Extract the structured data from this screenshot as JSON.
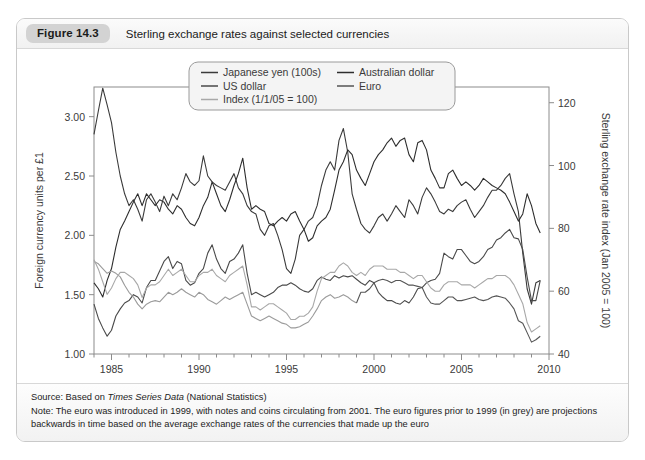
{
  "figure": {
    "badge": "Figure 14.3",
    "title": "Sterling exchange rates against selected currencies"
  },
  "footer": {
    "source_prefix": "Source: Based on ",
    "source_italic": "Times Series Data",
    "source_suffix": " (National Statistics)",
    "note": "Note: The euro was introduced in 1999, with notes and coins circulating from 2001. The euro figures prior to 1999 (in grey) are projections backwards in time based on the average exchange rates of the currencies that made up the euro"
  },
  "colors": {
    "yen": "#3b3b3b",
    "us_dollar": "#4a4a4a",
    "index": "#a8a8a8",
    "australian_dollar": "#2e2e2e",
    "euro": "#555555",
    "euro_projected": "#9b9b9b",
    "axis": "#8c8c8c",
    "text": "#3a3a3a",
    "legend_bg": "#f4f4f4",
    "legend_border": "#9a9a9a"
  },
  "chart_data": {
    "type": "line",
    "title": "Sterling exchange rates against selected currencies",
    "xlabel": "",
    "ylabel": "Foreign currency units per £1",
    "y2label": "Sterling exchange rate index (Jan 2005 = 100)",
    "xlim": [
      1984,
      2010
    ],
    "ylim": [
      1.0,
      3.25
    ],
    "y2lim": [
      40,
      125
    ],
    "yticks": [
      "1.00",
      "1.50",
      "2.00",
      "2.50",
      "3.00"
    ],
    "ytick_values": [
      1.0,
      1.5,
      2.0,
      2.5,
      3.0
    ],
    "y2ticks": [
      "40",
      "60",
      "80",
      "100",
      "120"
    ],
    "y2tick_values": [
      40,
      60,
      80,
      100,
      120
    ],
    "xticks": [
      "1985",
      "1990",
      "1995",
      "2000",
      "2005",
      "2010"
    ],
    "xtick_values": [
      1985,
      1990,
      1995,
      2000,
      2005,
      2010
    ],
    "grid": false,
    "legend_position": "top-center",
    "legend": [
      {
        "label": "Japanese yen (100s)",
        "color": "#3b3b3b"
      },
      {
        "label": "US dollar",
        "color": "#4a4a4a"
      },
      {
        "label": "Index (1/1/05 = 100)",
        "color": "#a8a8a8"
      },
      {
        "label": "Australian dollar",
        "color": "#2e2e2e"
      },
      {
        "label": "Euro",
        "color": "#555555"
      }
    ],
    "x": [
      1984.0,
      1984.25,
      1984.5,
      1984.75,
      1985.0,
      1985.25,
      1985.5,
      1985.75,
      1986.0,
      1986.25,
      1986.5,
      1986.75,
      1987.0,
      1987.25,
      1987.5,
      1987.75,
      1988.0,
      1988.25,
      1988.5,
      1988.75,
      1989.0,
      1989.25,
      1989.5,
      1989.75,
      1990.0,
      1990.25,
      1990.5,
      1990.75,
      1991.0,
      1991.25,
      1991.5,
      1991.75,
      1992.0,
      1992.25,
      1992.5,
      1992.75,
      1993.0,
      1993.25,
      1993.5,
      1993.75,
      1994.0,
      1994.25,
      1994.5,
      1994.75,
      1995.0,
      1995.25,
      1995.5,
      1995.75,
      1996.0,
      1996.25,
      1996.5,
      1996.75,
      1997.0,
      1997.25,
      1997.5,
      1997.75,
      1998.0,
      1998.25,
      1998.5,
      1998.75,
      1999.0,
      1999.25,
      1999.5,
      1999.75,
      2000.0,
      2000.25,
      2000.5,
      2000.75,
      2001.0,
      2001.25,
      2001.5,
      2001.75,
      2002.0,
      2002.25,
      2002.5,
      2002.75,
      2003.0,
      2003.25,
      2003.5,
      2003.75,
      2004.0,
      2004.25,
      2004.5,
      2004.75,
      2005.0,
      2005.25,
      2005.5,
      2005.75,
      2006.0,
      2006.25,
      2006.5,
      2006.75,
      2007.0,
      2007.25,
      2007.5,
      2007.75,
      2008.0,
      2008.25,
      2008.5,
      2008.75,
      2009.0,
      2009.25,
      2009.5
    ],
    "series": [
      {
        "name": "Japanese yen (100s)",
        "color": "#3b3b3b",
        "unit": "100 yen per £1",
        "axis": "left",
        "values": [
          2.85,
          3.05,
          3.24,
          3.1,
          2.95,
          2.7,
          2.5,
          2.35,
          2.25,
          2.3,
          2.22,
          2.12,
          2.3,
          2.35,
          2.28,
          2.2,
          2.33,
          2.25,
          2.35,
          2.3,
          2.4,
          2.52,
          2.45,
          2.42,
          2.46,
          2.67,
          2.5,
          2.45,
          2.42,
          2.4,
          2.38,
          2.45,
          2.52,
          2.4,
          2.35,
          2.25,
          2.2,
          2.18,
          2.05,
          2.0,
          2.08,
          2.1,
          2.0,
          1.88,
          1.72,
          1.68,
          1.8,
          2.0,
          2.05,
          2.12,
          2.15,
          2.25,
          2.42,
          2.55,
          2.62,
          2.55,
          2.8,
          2.9,
          2.7,
          2.35,
          2.22,
          2.1,
          2.05,
          2.02,
          2.08,
          2.15,
          2.18,
          2.12,
          2.18,
          2.25,
          2.2,
          2.15,
          2.3,
          2.25,
          2.18,
          2.32,
          2.4,
          2.35,
          2.28,
          2.2,
          2.18,
          2.22,
          2.2,
          2.25,
          2.28,
          2.3,
          2.22,
          2.15,
          2.2,
          2.25,
          2.32,
          2.38,
          2.38,
          2.42,
          2.48,
          2.52,
          2.35,
          2.2,
          1.85,
          1.55,
          1.42,
          1.6,
          1.62
        ]
      },
      {
        "name": "US dollar",
        "color": "#4a4a4a",
        "unit": "USD per £1",
        "axis": "left",
        "values": [
          1.42,
          1.3,
          1.22,
          1.15,
          1.2,
          1.32,
          1.38,
          1.43,
          1.45,
          1.5,
          1.48,
          1.43,
          1.56,
          1.62,
          1.62,
          1.7,
          1.78,
          1.82,
          1.72,
          1.78,
          1.76,
          1.62,
          1.58,
          1.6,
          1.68,
          1.72,
          1.85,
          1.92,
          1.8,
          1.72,
          1.68,
          1.78,
          1.8,
          1.85,
          1.92,
          1.68,
          1.5,
          1.52,
          1.5,
          1.48,
          1.5,
          1.52,
          1.56,
          1.58,
          1.58,
          1.6,
          1.58,
          1.55,
          1.53,
          1.52,
          1.55,
          1.62,
          1.65,
          1.63,
          1.62,
          1.66,
          1.64,
          1.66,
          1.65,
          1.66,
          1.63,
          1.6,
          1.58,
          1.62,
          1.6,
          1.52,
          1.48,
          1.45,
          1.45,
          1.43,
          1.42,
          1.45,
          1.43,
          1.48,
          1.55,
          1.56,
          1.6,
          1.62,
          1.63,
          1.68,
          1.85,
          1.82,
          1.8,
          1.88,
          1.88,
          1.83,
          1.78,
          1.76,
          1.78,
          1.82,
          1.88,
          1.9,
          1.96,
          1.98,
          2.02,
          2.05,
          1.98,
          1.97,
          1.88,
          1.65,
          1.45,
          1.45,
          1.62
        ]
      },
      {
        "name": "Australian dollar",
        "color": "#2e2e2e",
        "unit": "AUD per £1",
        "axis": "left",
        "values": [
          1.6,
          1.55,
          1.48,
          1.62,
          1.72,
          1.9,
          2.05,
          2.12,
          2.2,
          2.28,
          2.35,
          2.25,
          2.35,
          2.3,
          2.25,
          2.3,
          2.28,
          2.22,
          2.18,
          2.25,
          2.22,
          2.15,
          2.1,
          2.08,
          2.15,
          2.25,
          2.32,
          2.45,
          2.35,
          2.25,
          2.2,
          2.3,
          2.42,
          2.52,
          2.65,
          2.4,
          2.22,
          2.25,
          2.22,
          2.2,
          2.1,
          2.08,
          2.12,
          2.15,
          2.12,
          2.18,
          2.2,
          2.12,
          2.05,
          1.95,
          1.98,
          2.08,
          2.12,
          2.15,
          2.22,
          2.38,
          2.55,
          2.62,
          2.72,
          2.68,
          2.55,
          2.48,
          2.42,
          2.52,
          2.62,
          2.68,
          2.72,
          2.78,
          2.82,
          2.75,
          2.8,
          2.82,
          2.68,
          2.62,
          2.78,
          2.8,
          2.72,
          2.55,
          2.48,
          2.4,
          2.4,
          2.52,
          2.55,
          2.48,
          2.42,
          2.45,
          2.42,
          2.38,
          2.42,
          2.48,
          2.45,
          2.42,
          2.4,
          2.38,
          2.35,
          2.28,
          2.2,
          2.12,
          2.18,
          2.35,
          2.25,
          2.1,
          2.02
        ]
      },
      {
        "name": "Euro",
        "color": "#555555",
        "unit": "EUR per £1",
        "axis": "left",
        "projected_before": 1999,
        "projected_color": "#9b9b9b",
        "values": [
          1.78,
          1.76,
          1.72,
          1.68,
          1.7,
          1.68,
          1.65,
          1.58,
          1.52,
          1.48,
          1.42,
          1.38,
          1.42,
          1.44,
          1.45,
          1.44,
          1.48,
          1.52,
          1.5,
          1.52,
          1.55,
          1.52,
          1.5,
          1.48,
          1.52,
          1.5,
          1.46,
          1.44,
          1.42,
          1.45,
          1.48,
          1.46,
          1.48,
          1.5,
          1.52,
          1.42,
          1.32,
          1.3,
          1.28,
          1.3,
          1.32,
          1.3,
          1.28,
          1.26,
          1.25,
          1.22,
          1.22,
          1.23,
          1.25,
          1.27,
          1.32,
          1.38,
          1.45,
          1.48,
          1.5,
          1.47,
          1.48,
          1.5,
          1.48,
          1.45,
          1.43,
          1.52,
          1.52,
          1.55,
          1.6,
          1.62,
          1.63,
          1.62,
          1.6,
          1.62,
          1.62,
          1.6,
          1.58,
          1.58,
          1.57,
          1.56,
          1.48,
          1.43,
          1.42,
          1.42,
          1.45,
          1.48,
          1.48,
          1.45,
          1.45,
          1.46,
          1.47,
          1.48,
          1.46,
          1.45,
          1.46,
          1.48,
          1.49,
          1.48,
          1.47,
          1.43,
          1.38,
          1.28,
          1.26,
          1.18,
          1.1,
          1.12,
          1.15
        ]
      },
      {
        "name": "Index (1/1/05 = 100)",
        "color": "#a8a8a8",
        "unit": "index, Jan 2005 = 100",
        "axis": "right",
        "values": [
          70,
          67,
          63,
          59,
          61,
          64,
          66,
          66,
          65,
          64,
          62,
          58,
          61,
          62,
          62,
          63,
          65,
          67,
          65,
          66,
          67,
          65,
          63,
          63,
          65,
          66,
          66,
          67,
          65,
          64,
          63,
          65,
          66,
          67,
          68,
          62,
          55,
          55,
          54,
          55,
          56,
          56,
          55,
          54,
          53,
          51,
          51,
          52,
          52,
          53,
          55,
          60,
          64,
          65,
          66,
          66,
          68,
          69,
          68,
          66,
          65,
          66,
          65,
          67,
          68,
          68,
          68,
          67,
          67,
          67,
          66,
          66,
          65,
          64,
          65,
          65,
          63,
          61,
          60,
          60,
          62,
          63,
          63,
          63,
          62,
          62,
          62,
          61,
          62,
          63,
          64,
          64,
          65,
          65,
          65,
          64,
          62,
          59,
          56,
          50,
          47,
          48,
          49
        ]
      }
    ]
  }
}
